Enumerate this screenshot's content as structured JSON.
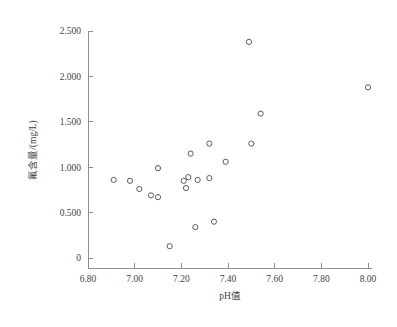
{
  "chart_data": {
    "type": "scatter",
    "title": "",
    "xlabel": "pH值",
    "ylabel": "氟含量/(mg/L)",
    "xlim": [
      6.8,
      8.0
    ],
    "ylim": [
      0,
      2.5
    ],
    "xticks": [
      "6.80",
      "7.00",
      "7.20",
      "7.40",
      "7.60",
      "7.80",
      "8.00"
    ],
    "xtick_values": [
      6.8,
      7.0,
      7.2,
      7.4,
      7.6,
      7.8,
      8.0
    ],
    "yticks": [
      "0",
      "0.500",
      "1.000",
      "1.500",
      "2.000",
      "2.500"
    ],
    "ytick_values": [
      0,
      0.5,
      1.0,
      1.5,
      2.0,
      2.5
    ],
    "grid": false,
    "legend": null,
    "marker": "open-circle",
    "marker_color": "#5b5b63",
    "x": [
      6.91,
      6.98,
      7.02,
      7.07,
      7.1,
      7.1,
      7.15,
      7.21,
      7.22,
      7.23,
      7.24,
      7.26,
      7.27,
      7.32,
      7.32,
      7.34,
      7.39,
      7.49,
      7.5,
      7.54,
      8.0,
      7.22
    ],
    "y": [
      0.86,
      0.85,
      0.76,
      0.69,
      0.99,
      0.67,
      0.13,
      0.85,
      0.77,
      0.89,
      1.15,
      0.34,
      0.86,
      1.26,
      0.88,
      0.4,
      1.06,
      2.38,
      1.26,
      1.59,
      1.88,
      0.85
    ],
    "points": [
      {
        "x": 6.91,
        "y": 0.86
      },
      {
        "x": 6.98,
        "y": 0.85
      },
      {
        "x": 7.02,
        "y": 0.76
      },
      {
        "x": 7.07,
        "y": 0.69
      },
      {
        "x": 7.1,
        "y": 0.99
      },
      {
        "x": 7.1,
        "y": 0.67
      },
      {
        "x": 7.15,
        "y": 0.13
      },
      {
        "x": 7.21,
        "y": 0.85
      },
      {
        "x": 7.22,
        "y": 0.77
      },
      {
        "x": 7.23,
        "y": 0.89
      },
      {
        "x": 7.24,
        "y": 1.15
      },
      {
        "x": 7.26,
        "y": 0.34
      },
      {
        "x": 7.27,
        "y": 0.86
      },
      {
        "x": 7.32,
        "y": 1.26
      },
      {
        "x": 7.32,
        "y": 0.88
      },
      {
        "x": 7.34,
        "y": 0.4
      },
      {
        "x": 7.39,
        "y": 1.06
      },
      {
        "x": 7.49,
        "y": 2.38
      },
      {
        "x": 7.5,
        "y": 1.26
      },
      {
        "x": 7.54,
        "y": 1.59
      },
      {
        "x": 8.0,
        "y": 1.88
      }
    ]
  }
}
